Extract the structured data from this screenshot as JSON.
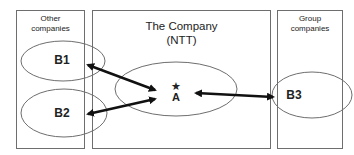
{
  "diagram": {
    "left_box": {
      "title_line1": "Other",
      "title_line2": "companies"
    },
    "middle_box": {
      "title_line1": "The Company",
      "title_line2": "(NTT)"
    },
    "right_box": {
      "title_line1": "Group",
      "title_line2": "companies"
    },
    "nodes": {
      "b1": "B1",
      "b2": "B2",
      "a": "A",
      "a_marker": "★",
      "b3": "B3"
    },
    "edges": [
      {
        "from": "B1",
        "to": "A",
        "direction": "bidirectional"
      },
      {
        "from": "B2",
        "to": "A",
        "direction": "bidirectional"
      },
      {
        "from": "A",
        "to": "B3",
        "direction": "bidirectional"
      }
    ],
    "colors": {
      "stroke": "#6e6e6e",
      "arrow": "#111111",
      "background": "#ffffff"
    }
  }
}
